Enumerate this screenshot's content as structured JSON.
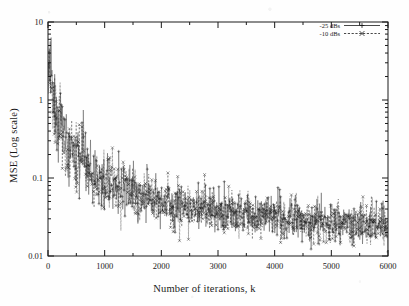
{
  "chart_data": {
    "type": "scatter",
    "title": "",
    "xlabel": "Number of iterations, k",
    "ylabel": "MSE (Log scale)",
    "xlim": [
      0,
      6000
    ],
    "ylim": [
      0.01,
      10
    ],
    "yscale": "log",
    "xscale": "linear",
    "grid": false,
    "frame": "box",
    "legend_position": "top-right",
    "xticks": [
      0,
      1000,
      2000,
      3000,
      4000,
      5000,
      6000
    ],
    "xtick_labels": [
      "0",
      "1000",
      "2000",
      "3000",
      "4000",
      "5000",
      "6000"
    ],
    "yticks": [
      0.01,
      0.1,
      1,
      10
    ],
    "ytick_labels": [
      "0.01",
      "0.1",
      "1",
      "10"
    ],
    "series": [
      {
        "name": "-25 dBs",
        "marker": "plus",
        "linestyle": "solid",
        "color": "#111111",
        "description": "Solid line with + markers; MSE decays from about 3 at k=0 to roughly 0.025 by k=6000",
        "x": [
          0,
          50,
          100,
          150,
          200,
          250,
          300,
          400,
          500,
          600,
          700,
          800,
          900,
          1000,
          1200,
          1400,
          1600,
          1800,
          2000,
          2200,
          2400,
          2600,
          2800,
          3000,
          3200,
          3400,
          3600,
          3800,
          4000,
          4200,
          4400,
          4600,
          4800,
          5000,
          5200,
          5400,
          5600,
          5800,
          6000
        ],
        "y": [
          3.0,
          1.7,
          1.1,
          0.8,
          0.62,
          0.46,
          0.38,
          0.27,
          0.2,
          0.16,
          0.13,
          0.115,
          0.1,
          0.09,
          0.078,
          0.07,
          0.062,
          0.056,
          0.05,
          0.047,
          0.044,
          0.042,
          0.04,
          0.038,
          0.036,
          0.035,
          0.034,
          0.033,
          0.032,
          0.031,
          0.03,
          0.029,
          0.029,
          0.028,
          0.028,
          0.027,
          0.027,
          0.026,
          0.026
        ]
      },
      {
        "name": "-10 dBs",
        "marker": "cross",
        "linestyle": "dashed",
        "color": "#111111",
        "description": "Dashed line with x markers; overlaps the -25 dBs trace, decaying from about 3 to roughly 0.025",
        "x": [
          0,
          50,
          100,
          150,
          200,
          250,
          300,
          400,
          500,
          600,
          700,
          800,
          900,
          1000,
          1200,
          1400,
          1600,
          1800,
          2000,
          2200,
          2400,
          2600,
          2800,
          3000,
          3200,
          3400,
          3600,
          3800,
          4000,
          4200,
          4400,
          4600,
          4800,
          5000,
          5200,
          5400,
          5600,
          5800,
          6000
        ],
        "y": [
          3.2,
          1.6,
          1.05,
          0.76,
          0.58,
          0.44,
          0.36,
          0.26,
          0.19,
          0.155,
          0.125,
          0.11,
          0.098,
          0.088,
          0.076,
          0.068,
          0.06,
          0.055,
          0.049,
          0.046,
          0.043,
          0.041,
          0.039,
          0.037,
          0.036,
          0.034,
          0.033,
          0.032,
          0.031,
          0.031,
          0.03,
          0.029,
          0.028,
          0.028,
          0.027,
          0.027,
          0.026,
          0.026,
          0.025
        ]
      }
    ],
    "scatter_spread": {
      "description": "Each series is a dense noisy per-iteration MSE trace; vertical spread is roughly a factor of 2.5 above and below the trend line, widening toward small k and staying bounded near 0.012-0.09 for large k"
    }
  },
  "axes": {
    "xlabel": "Number of iterations, k",
    "ylabel": "MSE (Log scale)"
  },
  "legend": {
    "entries": [
      {
        "label": "-25 dBs",
        "marker": "plus",
        "linestyle": "solid"
      },
      {
        "label": "-10 dBs",
        "marker": "cross",
        "linestyle": "dashed"
      }
    ]
  }
}
